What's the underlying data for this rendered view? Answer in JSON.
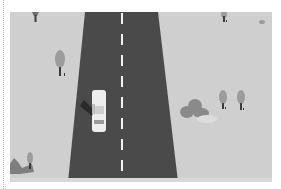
{
  "scene": {
    "description": "Top-down grayscale illustration of a straight two-lane road with a white car, trees and bushes on both sides",
    "colors": {
      "grass": "#cfcfcf",
      "road": "#4a4a4a",
      "lane_marking": "#f2f2f2",
      "car": "#eeeeee",
      "tree": "#9c9c9c",
      "trunk": "#3a3a3a",
      "bush": "#8a8a8a"
    },
    "elements": [
      {
        "type": "road",
        "orientation": "vertical"
      },
      {
        "type": "car",
        "color": "white",
        "lane": "left"
      },
      {
        "type": "tree",
        "side": "left"
      },
      {
        "type": "tree",
        "side": "right"
      },
      {
        "type": "bush",
        "side": "right"
      },
      {
        "type": "bush",
        "side": "left"
      }
    ]
  }
}
